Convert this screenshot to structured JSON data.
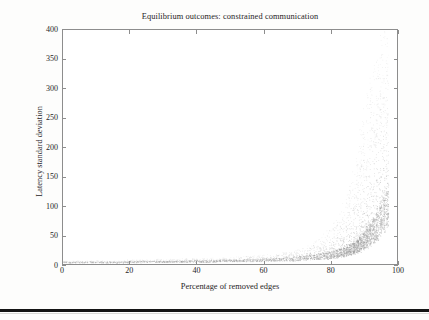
{
  "figure": {
    "title": "Equilibrium outcomes: constrained communication",
    "x_axis_label": "Percentage of removed edges",
    "y_axis_label": "Latency standard deviation"
  },
  "axes": {
    "x_ticks": [
      "0",
      "20",
      "40",
      "60",
      "80",
      "100"
    ],
    "y_ticks": [
      "0",
      "50",
      "100",
      "150",
      "200",
      "250",
      "300",
      "350",
      "400"
    ]
  },
  "style": {
    "frame_color": "#8d8d8d",
    "marker_color": "#9a9a9a",
    "text_color": "#26241f",
    "background": "#ffffff",
    "rule_color": "#141414"
  },
  "chart_data": {
    "type": "scatter",
    "title": "Equilibrium outcomes: constrained communication",
    "xlabel": "Percentage of removed edges",
    "ylabel": "Latency standard deviation",
    "xlim": [
      0,
      100
    ],
    "ylim": [
      0,
      400
    ],
    "xticks": [
      0,
      20,
      40,
      60,
      80,
      100
    ],
    "yticks": [
      0,
      50,
      100,
      150,
      200,
      250,
      300,
      350,
      400
    ],
    "grid": false,
    "legend": null,
    "marker": "dot",
    "marker_size": 0.8,
    "series": [
      {
        "name": "latency standard deviation",
        "color": "#9a9a9a",
        "x": [
          0,
          1,
          2,
          3,
          4,
          5,
          6,
          7,
          8,
          9,
          10,
          11,
          12,
          13,
          14,
          15,
          16,
          17,
          18,
          19,
          20,
          21,
          22,
          23,
          24,
          25,
          26,
          27,
          28,
          29,
          30,
          31,
          32,
          33,
          34,
          35,
          36,
          37,
          38,
          39,
          40,
          41,
          42,
          43,
          44,
          45,
          46,
          47,
          48,
          49,
          50,
          51,
          52,
          53,
          54,
          55,
          56,
          57,
          58,
          59,
          60,
          61,
          62,
          63,
          64,
          65,
          66,
          67,
          68,
          69,
          70,
          71,
          72,
          73,
          74,
          75,
          76,
          77,
          78,
          79,
          80,
          81,
          82,
          83,
          84,
          85,
          86,
          87,
          88,
          89,
          90,
          91,
          92,
          93,
          94,
          95,
          96,
          97
        ],
        "y_median": [
          4,
          4,
          4,
          4,
          4,
          4,
          4,
          4,
          4,
          4,
          4,
          4,
          4,
          4,
          4,
          4,
          4,
          4,
          4,
          4,
          5,
          5,
          5,
          5,
          5,
          5,
          5,
          5,
          5,
          5,
          5,
          5,
          5,
          5,
          5,
          5,
          5,
          6,
          6,
          6,
          6,
          6,
          6,
          6,
          6,
          6,
          6,
          7,
          7,
          7,
          7,
          7,
          7,
          7,
          7,
          8,
          8,
          8,
          8,
          8,
          9,
          9,
          9,
          9,
          10,
          10,
          10,
          11,
          11,
          12,
          12,
          13,
          13,
          14,
          15,
          15,
          16,
          17,
          18,
          19,
          20,
          21,
          23,
          25,
          27,
          29,
          32,
          35,
          39,
          44,
          50,
          57,
          65,
          74,
          84,
          95,
          108,
          120
        ],
        "y_upper": [
          6,
          6,
          6,
          6,
          6,
          6,
          6,
          6,
          6,
          7,
          7,
          7,
          7,
          7,
          7,
          7,
          7,
          7,
          7,
          8,
          8,
          8,
          8,
          8,
          8,
          8,
          8,
          8,
          9,
          9,
          9,
          9,
          9,
          9,
          9,
          9,
          10,
          10,
          10,
          10,
          10,
          10,
          11,
          11,
          11,
          11,
          11,
          12,
          12,
          12,
          12,
          13,
          13,
          13,
          14,
          14,
          14,
          15,
          15,
          16,
          16,
          17,
          17,
          18,
          19,
          20,
          21,
          22,
          23,
          25,
          26,
          28,
          30,
          33,
          36,
          39,
          43,
          47,
          52,
          58,
          65,
          73,
          82,
          93,
          105,
          120,
          140,
          165,
          195,
          225,
          255,
          285,
          310,
          335,
          355,
          375,
          390,
          390
        ],
        "y_lower": [
          2,
          2,
          2,
          2,
          2,
          2,
          2,
          2,
          2,
          2,
          2,
          2,
          2,
          2,
          2,
          2,
          2,
          2,
          2,
          2,
          2,
          2,
          2,
          2,
          2,
          3,
          3,
          3,
          3,
          3,
          3,
          3,
          3,
          3,
          3,
          3,
          3,
          3,
          3,
          3,
          3,
          3,
          3,
          3,
          3,
          3,
          3,
          4,
          4,
          4,
          4,
          4,
          4,
          4,
          4,
          4,
          4,
          4,
          4,
          4,
          4,
          5,
          5,
          5,
          5,
          5,
          5,
          5,
          5,
          5,
          6,
          6,
          6,
          6,
          6,
          7,
          7,
          7,
          8,
          8,
          9,
          9,
          10,
          11,
          12,
          13,
          14,
          16,
          18,
          20,
          23,
          26,
          30,
          34,
          39,
          45,
          52,
          60
        ]
      }
    ]
  }
}
